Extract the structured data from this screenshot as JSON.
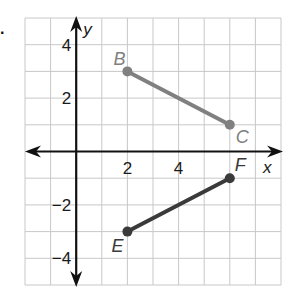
{
  "question_marker": ".",
  "chart_data": {
    "type": "scatter",
    "title": "",
    "xlabel": "x",
    "ylabel": "y",
    "xlim": [
      -2,
      8
    ],
    "ylim": [
      -5,
      5
    ],
    "grid": true,
    "x_tick_labels": [
      {
        "value": 2,
        "label": "2"
      },
      {
        "value": 4,
        "label": "4"
      }
    ],
    "y_tick_labels": [
      {
        "value": 4,
        "label": "4"
      },
      {
        "value": 2,
        "label": "2"
      },
      {
        "value": -2,
        "label": "−2"
      },
      {
        "value": -4,
        "label": "−4"
      }
    ],
    "segments": [
      {
        "name": "BC",
        "color": "#808080",
        "points": [
          {
            "label": "B",
            "x": 2,
            "y": 3
          },
          {
            "label": "C",
            "x": 6,
            "y": 1
          }
        ]
      },
      {
        "name": "EF",
        "color": "#3a3a3a",
        "points": [
          {
            "label": "E",
            "x": 2,
            "y": -3
          },
          {
            "label": "F",
            "x": 6,
            "y": -1
          }
        ]
      }
    ]
  }
}
